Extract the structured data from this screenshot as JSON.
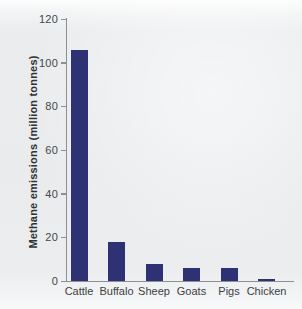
{
  "chart_data": {
    "type": "bar",
    "categories": [
      "Cattle",
      "Buffalo",
      "Sheep",
      "Goats",
      "Pigs",
      "Chicken"
    ],
    "values": [
      106,
      18,
      8,
      6,
      6,
      1
    ],
    "title": "",
    "xlabel": "",
    "ylabel": "Methane emissions (million tonnes)",
    "ylim": [
      0,
      120
    ],
    "yticks": [
      0,
      20,
      40,
      60,
      80,
      100,
      120
    ],
    "grid": false,
    "legend": null,
    "colors": {
      "bar": "#2e3274",
      "axis": "#8d9093",
      "tick_text": "#45474a",
      "category_text": "#3d3f42",
      "background": "#eaecee"
    }
  }
}
